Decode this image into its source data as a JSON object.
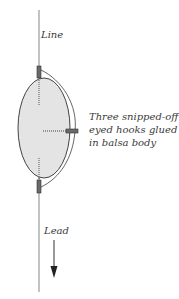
{
  "labels": {
    "line": "Line",
    "lead": "Lead",
    "annotation": [
      "Three snipped-off",
      "eyed hooks glued",
      "in balsa body"
    ]
  },
  "colors": {
    "stroke": "#3a3a3a",
    "line": "#8a8a8a",
    "body_fill": "#e4e4e4",
    "hook": "#6a6a6a"
  },
  "parts": {
    "hook_count": 3
  }
}
